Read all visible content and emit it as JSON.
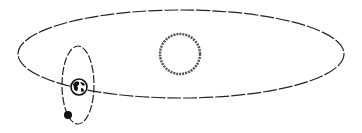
{
  "diagram": {
    "colors": {
      "line": "#222222",
      "background": "#ffffff",
      "sun_stroke": "#555555",
      "moon_fill": "#111111"
    },
    "elements": [
      {
        "name": "earth-orbit",
        "type": "ellipse",
        "cx": 181,
        "cy": 54,
        "rx": 163,
        "ry": 44
      },
      {
        "name": "sun",
        "type": "circle",
        "cx": 180,
        "cy": 54,
        "r": 20
      },
      {
        "name": "moon-orbit",
        "type": "ellipse",
        "cx": 78,
        "cy": 85,
        "rx": 16,
        "ry": 39
      },
      {
        "name": "earth",
        "type": "circle",
        "cx": 79,
        "cy": 87,
        "r": 8
      },
      {
        "name": "moon",
        "type": "circle",
        "cx": 68,
        "cy": 115,
        "r": 4
      }
    ]
  }
}
